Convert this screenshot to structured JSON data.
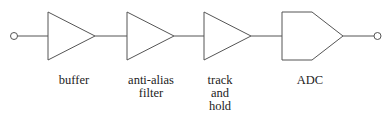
{
  "diagram": {
    "type": "signal-chain block diagram",
    "stroke_color": "#555555",
    "blocks": [
      {
        "id": "buffer",
        "label_lines": [
          "buffer"
        ],
        "shape": "triangle"
      },
      {
        "id": "anti-alias-filter",
        "label_lines": [
          "anti-alias",
          "filter"
        ],
        "shape": "triangle"
      },
      {
        "id": "track-and-hold",
        "label_lines": [
          "track",
          "and",
          "hold"
        ],
        "shape": "triangle"
      },
      {
        "id": "adc",
        "label_lines": [
          "ADC"
        ],
        "shape": "pentagon"
      }
    ],
    "terminals": {
      "input": "open-circle",
      "output": "open-circle"
    }
  }
}
